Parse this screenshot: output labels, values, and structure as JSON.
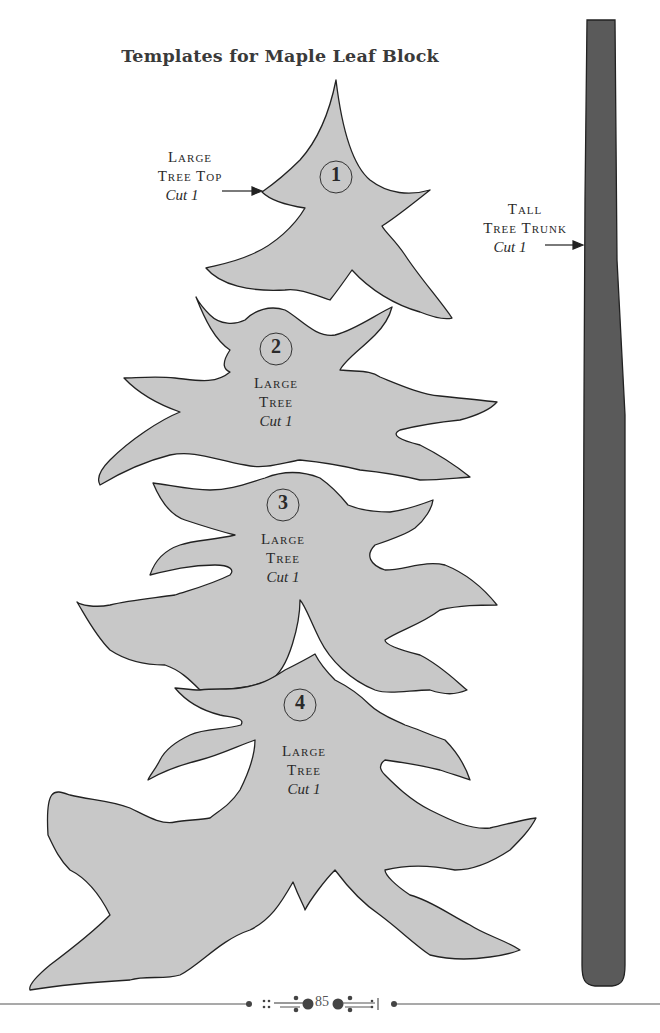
{
  "page": {
    "title": "Templates for Maple Leaf Block",
    "page_number": "85"
  },
  "colors": {
    "template_fill": "#c8c8c8",
    "template_outline": "#222222",
    "trunk_fill": "#5a5a5a",
    "text": "#2a2a2a"
  },
  "templates": [
    {
      "number": "1",
      "name_line1": "Large",
      "name_line2": "Tree Top",
      "cut": "Cut 1"
    },
    {
      "number": "2",
      "name_line1": "Large",
      "name_line2": "Tree",
      "cut": "Cut 1"
    },
    {
      "number": "3",
      "name_line1": "Large",
      "name_line2": "Tree",
      "cut": "Cut 1"
    },
    {
      "number": "4",
      "name_line1": "Large",
      "name_line2": "Tree",
      "cut": "Cut 1"
    }
  ],
  "trunk": {
    "name_line1": "Tall",
    "name_line2": "Tree Trunk",
    "cut": "Cut 1"
  }
}
